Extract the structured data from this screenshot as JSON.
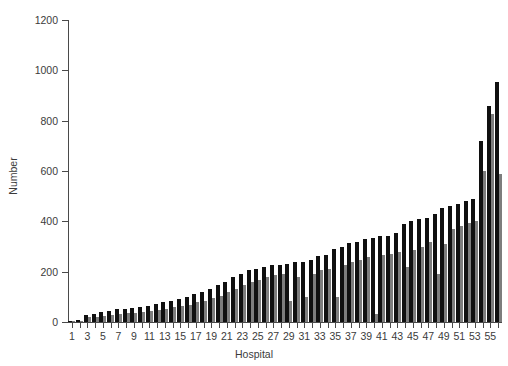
{
  "chart_data": {
    "type": "bar",
    "title": "",
    "subtitle": "",
    "xlabel": "Hospital",
    "ylabel": "Number",
    "ylim": [
      0,
      1200
    ],
    "ytick_labels": [
      "1200",
      "1000",
      "800",
      "600",
      "400",
      "200",
      "0"
    ],
    "ytick_values": [
      1200,
      1000,
      800,
      600,
      400,
      200,
      0
    ],
    "xlim": [
      0.5,
      56.5
    ],
    "xtick_labels": [
      "1",
      "3",
      "5",
      "7",
      "9",
      "11",
      "13",
      "15",
      "17",
      "19",
      "21",
      "23",
      "25",
      "27",
      "29",
      "31",
      "33",
      "35",
      "37",
      "39",
      "41",
      "43",
      "45",
      "47",
      "49",
      "51",
      "53",
      "55"
    ],
    "xtick_values": [
      1,
      3,
      5,
      7,
      9,
      11,
      13,
      15,
      17,
      19,
      21,
      23,
      25,
      27,
      29,
      31,
      33,
      35,
      37,
      39,
      41,
      43,
      45,
      47,
      49,
      51,
      53,
      55
    ],
    "grid": false,
    "legend": null,
    "legend_position": "none",
    "colors": {
      "series_dark": "#101010",
      "series_light": "#7d7d7d",
      "axis": "#4a4a4a",
      "text": "#3b3b3b",
      "background": "#ffffff"
    },
    "categories": [
      1,
      2,
      3,
      4,
      5,
      6,
      7,
      8,
      9,
      10,
      11,
      12,
      13,
      14,
      15,
      16,
      17,
      18,
      19,
      20,
      21,
      22,
      23,
      24,
      25,
      26,
      27,
      28,
      29,
      30,
      31,
      32,
      33,
      34,
      35,
      36,
      37,
      38,
      39,
      40,
      41,
      42,
      43,
      44,
      45,
      46,
      47,
      48,
      49,
      50,
      51,
      52,
      53,
      54,
      55,
      56
    ],
    "series": [
      {
        "name": "dark",
        "color": "#101010",
        "values": [
          5,
          8,
          28,
          30,
          38,
          42,
          50,
          52,
          55,
          60,
          65,
          72,
          78,
          85,
          92,
          100,
          112,
          120,
          132,
          148,
          160,
          178,
          192,
          205,
          212,
          218,
          225,
          228,
          230,
          238,
          240,
          248,
          262,
          268,
          290,
          300,
          312,
          318,
          330,
          332,
          340,
          342,
          352,
          390,
          400,
          408,
          412,
          428,
          455,
          462,
          470,
          480,
          490,
          720,
          858,
          955
        ]
      },
      {
        "name": "light",
        "color": "#7d7d7d",
        "values": [
          3,
          5,
          18,
          20,
          24,
          28,
          32,
          34,
          36,
          40,
          44,
          48,
          52,
          58,
          62,
          68,
          78,
          85,
          95,
          105,
          118,
          132,
          148,
          160,
          168,
          178,
          185,
          190,
          85,
          180,
          100,
          192,
          205,
          212,
          100,
          228,
          240,
          248,
          258,
          30,
          265,
          272,
          280,
          220,
          285,
          300,
          318,
          190,
          310,
          368,
          382,
          392,
          400,
          600,
          828,
          588
        ]
      }
    ]
  }
}
